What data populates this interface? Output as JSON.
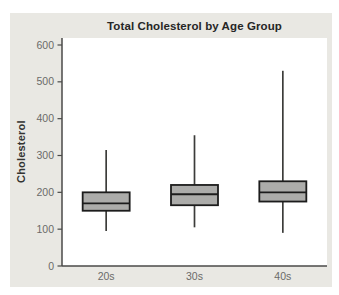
{
  "window": {
    "background": "#ffffff",
    "card_background": "#e9e8e3"
  },
  "chart_data": {
    "type": "box",
    "title": "Total Cholesterol by Age Group",
    "ylabel": "Cholesterol",
    "xlabel": "",
    "categories": [
      "20s",
      "30s",
      "40s"
    ],
    "ylim": [
      0,
      600
    ],
    "yticks": [
      0,
      100,
      200,
      300,
      400,
      500,
      600
    ],
    "grid": false,
    "legend": false,
    "series": [
      {
        "category": "20s",
        "whisker_low": 95,
        "q1": 150,
        "median": 170,
        "q3": 200,
        "whisker_high": 315
      },
      {
        "category": "30s",
        "whisker_low": 105,
        "q1": 165,
        "median": 195,
        "q3": 220,
        "whisker_high": 355
      },
      {
        "category": "40s",
        "whisker_low": 90,
        "q1": 175,
        "median": 200,
        "q3": 230,
        "whisker_high": 530
      }
    ],
    "colors": {
      "box_fill": "#acacaa",
      "box_stroke": "#1c1c1c",
      "median": "#1c1c1c",
      "whisker": "#3c3c3a",
      "axis": "#4a4a48",
      "tick_label": "#6b6b69",
      "title": "#262626",
      "plot_background": "#ffffff"
    }
  }
}
